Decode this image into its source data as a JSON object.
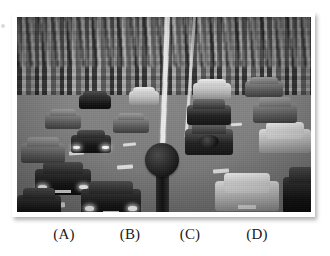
{
  "figure": {
    "type": "multiple-choice-image-figure",
    "background_color": "#ffffff",
    "photo": {
      "alt_description": "Black and white photograph of a severe traffic jam: many cars packed in lanes of a wide road, seen from an elevated viewpoint, with a central painted white divider line and a round dark traffic sign on a post.",
      "palette": "grayscale",
      "frame_color": "#ffffff",
      "has_drop_shadow": true,
      "elements": [
        "dense-car-rows",
        "center-lane-line",
        "dashed-lane-markings",
        "round-traffic-sign",
        "dark-sedans-foreground-left",
        "light-estate-car-foreground-right",
        "dark-suv-with-spare-tyre"
      ]
    },
    "choices": [
      {
        "key": "A",
        "label": "(A)"
      },
      {
        "key": "B",
        "label": "(B)"
      },
      {
        "key": "C",
        "label": "(C)"
      },
      {
        "key": "D",
        "label": "(D)"
      }
    ]
  }
}
